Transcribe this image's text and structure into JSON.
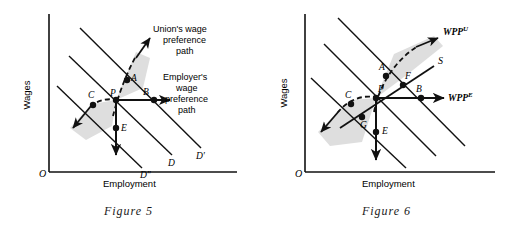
{
  "page": {
    "background": "#ffffff",
    "ink": "#111111",
    "shade": "#d9d9d9"
  },
  "figures": [
    {
      "id": "figure-5",
      "caption": "Figure 5",
      "axes": {
        "origin_label": "O",
        "x_label": "Employment",
        "y_label": "Wages"
      },
      "curve_labels": [
        {
          "key": "d2",
          "text": "D″"
        },
        {
          "key": "d",
          "text": "D"
        },
        {
          "key": "d1",
          "text": "D′"
        }
      ],
      "points": [
        {
          "key": "A",
          "text": "A"
        },
        {
          "key": "P",
          "text": "P"
        },
        {
          "key": "B",
          "text": "B"
        },
        {
          "key": "C",
          "text": "C"
        },
        {
          "key": "E",
          "text": "E"
        }
      ],
      "annotations": [
        {
          "key": "union",
          "lines": [
            "Union's wage",
            "preference",
            "path"
          ]
        },
        {
          "key": "employer",
          "lines": [
            "Employer's",
            "wage",
            "preference",
            "path"
          ]
        }
      ]
    },
    {
      "id": "figure-6",
      "caption": "Figure 6",
      "axes": {
        "origin_label": "O",
        "x_label": "Employment",
        "y_label": "Wages"
      },
      "curve_labels": [
        {
          "key": "s",
          "text": "S"
        }
      ],
      "points": [
        {
          "key": "A",
          "text": "A"
        },
        {
          "key": "F",
          "text": "F"
        },
        {
          "key": "P",
          "text": "P"
        },
        {
          "key": "B",
          "text": "B"
        },
        {
          "key": "C",
          "text": "C"
        },
        {
          "key": "G",
          "text": "G"
        },
        {
          "key": "E",
          "text": "E"
        }
      ],
      "annotations": [
        {
          "key": "wpp-u",
          "base": "WPP",
          "sup": "U"
        },
        {
          "key": "wpp-e",
          "base": "WPP",
          "sup": "E"
        }
      ]
    }
  ]
}
